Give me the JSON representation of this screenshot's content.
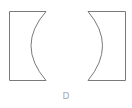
{
  "figure": {
    "label": "D",
    "stroke_color": "#7a7a7a",
    "label_color": "#a8a8a8",
    "shapes": [
      {
        "name": "left-concave-block",
        "description": "rectangle with concave right side"
      },
      {
        "name": "right-concave-block",
        "description": "rectangle with concave left side"
      }
    ]
  }
}
